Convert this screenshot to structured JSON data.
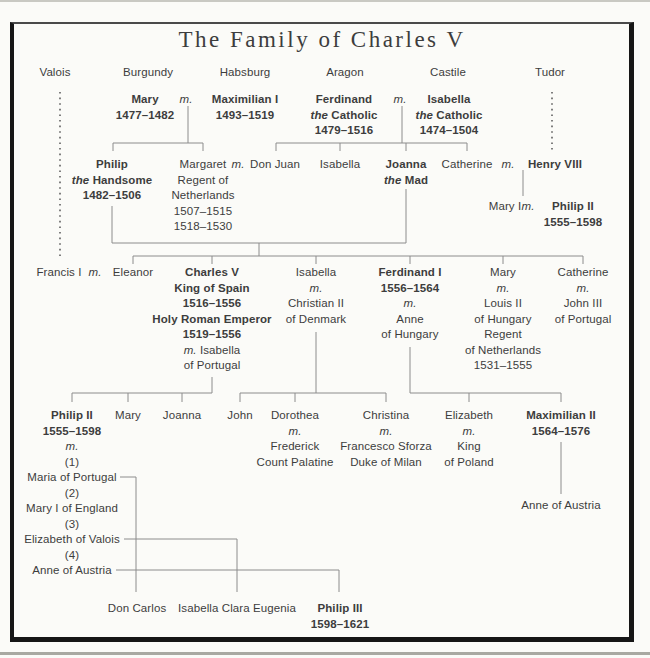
{
  "title": "The Family of Charles V",
  "colors": {
    "background": "#fbfbf8",
    "text": "#3d3d3d",
    "line": "#8c8c8c",
    "frame": "#161616"
  },
  "nodes": [
    {
      "id": "dynasty-valois",
      "x": 55,
      "y": 65,
      "lines": [
        "Valois"
      ]
    },
    {
      "id": "dynasty-burgundy",
      "x": 148,
      "y": 65,
      "lines": [
        "Burgundy"
      ]
    },
    {
      "id": "dynasty-habsburg",
      "x": 245,
      "y": 65,
      "lines": [
        "Habsburg"
      ]
    },
    {
      "id": "dynasty-aragon",
      "x": 345,
      "y": 65,
      "lines": [
        "Aragon"
      ]
    },
    {
      "id": "dynasty-castile",
      "x": 448,
      "y": 65,
      "lines": [
        "Castile"
      ]
    },
    {
      "id": "dynasty-tudor",
      "x": 550,
      "y": 65,
      "lines": [
        "Tudor"
      ]
    },
    {
      "id": "mary-of-burgundy",
      "x": 145,
      "y": 92,
      "lines": [
        {
          "b": 1,
          "t": "Mary"
        },
        {
          "b": 1,
          "t": "1477–1482"
        }
      ]
    },
    {
      "id": "m-mary-maximilian",
      "x": 186,
      "y": 92,
      "lines": [
        {
          "i": 1,
          "t": "m."
        }
      ]
    },
    {
      "id": "maximilian-i",
      "x": 245,
      "y": 92,
      "lines": [
        {
          "b": 1,
          "t": "Maximilian I"
        },
        {
          "b": 1,
          "t": "1493–1519"
        }
      ]
    },
    {
      "id": "ferdinand-the-catholic",
      "x": 344,
      "y": 92,
      "lines": [
        {
          "b": 1,
          "t": "Ferdinand"
        },
        {
          "b": 1,
          "s": [
            {
              "t": "the ",
              "i": 1
            },
            {
              "t": "Catholic"
            }
          ]
        },
        {
          "b": 1,
          "t": "1479–1516"
        }
      ]
    },
    {
      "id": "m-ferdinand-isabella",
      "x": 400,
      "y": 92,
      "lines": [
        {
          "i": 1,
          "t": "m."
        }
      ]
    },
    {
      "id": "isabella-the-catholic",
      "x": 449,
      "y": 92,
      "lines": [
        {
          "b": 1,
          "t": "Isabella"
        },
        {
          "b": 1,
          "s": [
            {
              "t": "the ",
              "i": 1
            },
            {
              "t": "Catholic"
            }
          ]
        },
        {
          "b": 1,
          "t": "1474–1504"
        }
      ]
    },
    {
      "id": "philip-the-handsome",
      "x": 112,
      "y": 157,
      "lines": [
        {
          "b": 1,
          "t": "Philip"
        },
        {
          "b": 1,
          "s": [
            {
              "t": "the ",
              "i": 1
            },
            {
              "t": "Handsome"
            }
          ]
        },
        {
          "b": 1,
          "t": "1482–1506"
        }
      ]
    },
    {
      "id": "margaret-regent",
      "x": 203,
      "y": 157,
      "lines": [
        "Margaret",
        "Regent of",
        "Netherlands",
        "1507–1515",
        "1518–1530"
      ]
    },
    {
      "id": "m-margaret-don-juan",
      "x": 238,
      "y": 157,
      "lines": [
        {
          "i": 1,
          "t": "m."
        }
      ]
    },
    {
      "id": "don-juan",
      "x": 275,
      "y": 157,
      "lines": [
        "Don Juan"
      ]
    },
    {
      "id": "isabella-of-aragon",
      "x": 340,
      "y": 157,
      "lines": [
        "Isabella"
      ]
    },
    {
      "id": "joanna-the-mad",
      "x": 406,
      "y": 157,
      "lines": [
        {
          "b": 1,
          "t": "Joanna"
        },
        {
          "b": 1,
          "s": [
            {
              "t": "the ",
              "i": 1
            },
            {
              "t": "Mad"
            }
          ]
        }
      ]
    },
    {
      "id": "catherine-of-aragon",
      "x": 467,
      "y": 157,
      "lines": [
        "Catherine"
      ]
    },
    {
      "id": "m-catherine-henry",
      "x": 508,
      "y": 157,
      "lines": [
        {
          "i": 1,
          "t": "m."
        }
      ]
    },
    {
      "id": "henry-viii",
      "x": 555,
      "y": 157,
      "lines": [
        {
          "b": 1,
          "t": "Henry VIII"
        }
      ]
    },
    {
      "id": "mary-i",
      "x": 505,
      "y": 199,
      "lines": [
        "Mary I"
      ]
    },
    {
      "id": "m-mary-i-philip-ii",
      "x": 528,
      "y": 199,
      "lines": [
        {
          "i": 1,
          "t": "m."
        }
      ]
    },
    {
      "id": "philip-ii-of-spain-tudor",
      "x": 573,
      "y": 199,
      "lines": [
        {
          "b": 1,
          "t": "Philip II"
        },
        {
          "b": 1,
          "t": "1555–1598"
        }
      ]
    },
    {
      "id": "francis-i",
      "x": 59,
      "y": 265,
      "lines": [
        "Francis I"
      ]
    },
    {
      "id": "m-francis-eleanor",
      "x": 95,
      "y": 265,
      "lines": [
        {
          "i": 1,
          "t": "m."
        }
      ]
    },
    {
      "id": "eleanor",
      "x": 133,
      "y": 265,
      "lines": [
        "Eleanor"
      ]
    },
    {
      "id": "charles-v",
      "x": 212,
      "y": 265,
      "lines": [
        {
          "b": 1,
          "t": "Charles V"
        },
        {
          "b": 1,
          "t": "King of Spain"
        },
        {
          "b": 1,
          "t": "1516–1556"
        },
        {
          "b": 1,
          "t": "Holy Roman Emperor"
        },
        {
          "b": 1,
          "t": "1519–1556"
        },
        {
          "s": [
            {
              "t": "m. ",
              "i": 1
            },
            {
              "t": "Isabella"
            }
          ]
        },
        "of Portugal"
      ]
    },
    {
      "id": "isabella-of-austria",
      "x": 316,
      "y": 265,
      "lines": [
        "Isabella",
        {
          "i": 1,
          "t": "m."
        },
        "Christian II",
        "of Denmark"
      ]
    },
    {
      "id": "ferdinand-i",
      "x": 410,
      "y": 265,
      "lines": [
        {
          "b": 1,
          "t": "Ferdinand I"
        },
        {
          "b": 1,
          "t": "1556–1564"
        },
        {
          "i": 1,
          "t": "m."
        },
        "Anne",
        "of Hungary"
      ]
    },
    {
      "id": "mary-of-hungary",
      "x": 503,
      "y": 265,
      "lines": [
        "Mary",
        {
          "i": 1,
          "t": "m."
        },
        "Louis II",
        "of Hungary",
        "Regent",
        "of Netherlands",
        "1531–1555"
      ]
    },
    {
      "id": "catherine-of-austria",
      "x": 583,
      "y": 265,
      "lines": [
        "Catherine",
        {
          "i": 1,
          "t": "m."
        },
        "John III",
        "of Portugal"
      ]
    },
    {
      "id": "philip-ii",
      "x": 72,
      "y": 408,
      "lines": [
        {
          "b": 1,
          "t": "Philip II"
        },
        {
          "b": 1,
          "t": "1555–1598"
        },
        {
          "i": 1,
          "t": "m."
        },
        "(1)",
        "Maria of Portugal",
        "(2)",
        "Mary I of England",
        "(3)",
        "Elizabeth of Valois",
        "(4)",
        "Anne of Austria"
      ]
    },
    {
      "id": "mary-of-spain",
      "x": 128,
      "y": 408,
      "lines": [
        "Mary"
      ]
    },
    {
      "id": "joanna-of-spain",
      "x": 182,
      "y": 408,
      "lines": [
        "Joanna"
      ]
    },
    {
      "id": "john-of-denmark",
      "x": 240,
      "y": 408,
      "lines": [
        "John"
      ]
    },
    {
      "id": "dorothea",
      "x": 295,
      "y": 408,
      "lines": [
        "Dorothea",
        {
          "i": 1,
          "t": "m."
        },
        "Frederick",
        "Count Palatine"
      ]
    },
    {
      "id": "christina",
      "x": 386,
      "y": 408,
      "lines": [
        "Christina",
        {
          "i": 1,
          "t": "m."
        },
        "Francesco Sforza",
        "Duke of Milan"
      ]
    },
    {
      "id": "elizabeth-of-austria",
      "x": 469,
      "y": 408,
      "lines": [
        "Elizabeth",
        {
          "i": 1,
          "t": "m."
        },
        "King",
        "of Poland"
      ]
    },
    {
      "id": "maximilian-ii",
      "x": 561,
      "y": 408,
      "lines": [
        {
          "b": 1,
          "t": "Maximilian II"
        },
        {
          "b": 1,
          "t": "1564–1576"
        }
      ]
    },
    {
      "id": "anne-of-austria",
      "x": 561,
      "y": 498,
      "lines": [
        "Anne of Austria"
      ]
    },
    {
      "id": "don-carlos",
      "x": 137,
      "y": 601,
      "lines": [
        "Don Carlos"
      ]
    },
    {
      "id": "isabella-clara-eugenia",
      "x": 237,
      "y": 601,
      "lines": [
        "Isabella Clara Eugenia"
      ]
    },
    {
      "id": "philip-iii",
      "x": 340,
      "y": 601,
      "lines": [
        {
          "b": 1,
          "t": "Philip III"
        },
        {
          "b": 1,
          "t": "1598–1621"
        }
      ]
    }
  ]
}
